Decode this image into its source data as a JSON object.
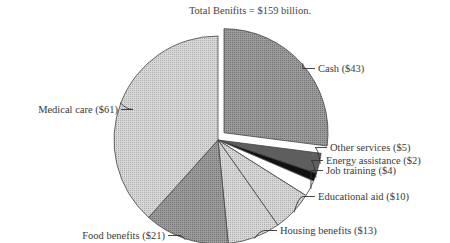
{
  "chart_data": {
    "type": "pie",
    "title": "Total Benifits = $159 billion.",
    "unit": "billion $",
    "total": 159,
    "exploded": "Cash",
    "slices": [
      {
        "label": "Cash ($43)",
        "name": "Cash",
        "value": 43,
        "color": "#8c8c8c",
        "pattern": "dense"
      },
      {
        "label": "Other services ($5)",
        "name": "Other services",
        "value": 5,
        "color": "#5e5e5e",
        "pattern": "dense"
      },
      {
        "label": "Energy assistance ($2)",
        "name": "Energy assistance",
        "value": 2,
        "color": "#111111",
        "pattern": "solid"
      },
      {
        "label": "Job training ($4)",
        "name": "Job training",
        "value": 4,
        "color": "#ffffff",
        "pattern": "solid"
      },
      {
        "label": "Educational aid ($10)",
        "name": "Educational aid",
        "value": 10,
        "color": "#bdbdbd",
        "pattern": "light"
      },
      {
        "label": "Housing benefits ($13)",
        "name": "Housing benefits",
        "value": 13,
        "color": "#dedede",
        "pattern": "light"
      },
      {
        "label": "Food benefits ($21)",
        "name": "Food benefits",
        "value": 21,
        "color": "#9a9a9a",
        "pattern": "dense"
      },
      {
        "label": "Medical care ($61)",
        "name": "Medical care",
        "value": 61,
        "color": "#c4c4c4",
        "pattern": "light"
      }
    ]
  }
}
